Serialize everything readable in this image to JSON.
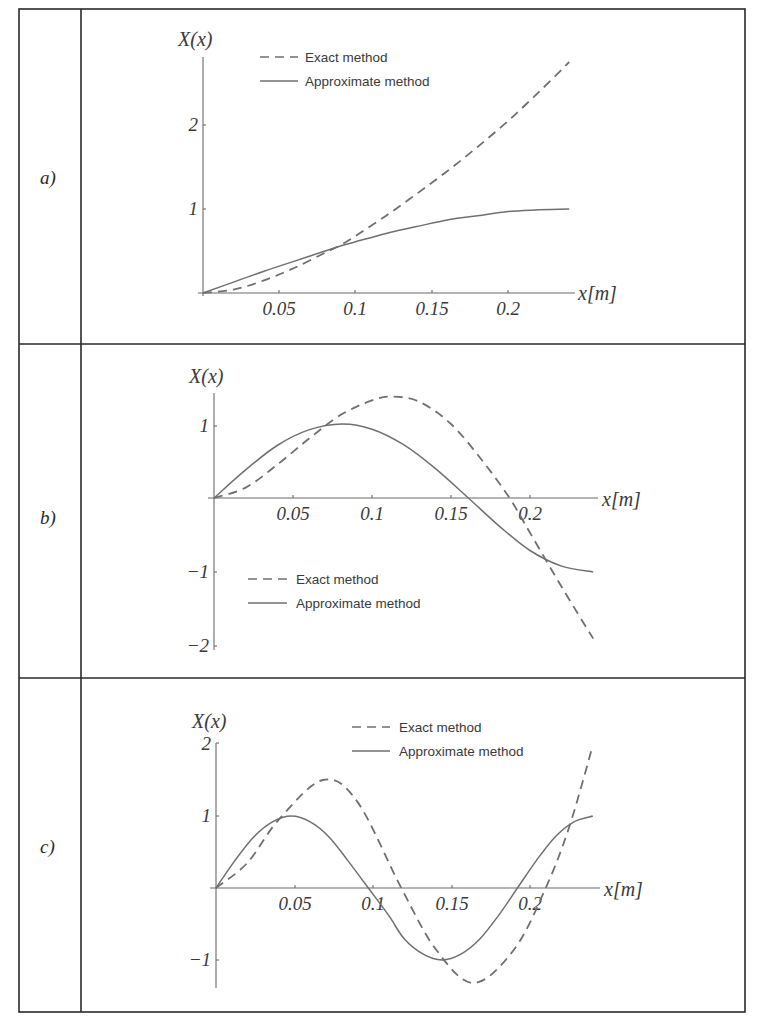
{
  "table": {
    "row_labels": [
      "a)",
      "b)",
      "c)"
    ]
  },
  "legend": {
    "exact": "Exact method",
    "approx": "Approximate method"
  },
  "axis": {
    "y_title": "X(x)",
    "x_title": "x[m]"
  },
  "colors": {
    "border": "#2a2a2a",
    "axis": "#6a6a6a",
    "curve": "#707070",
    "text": "#3a3a3a"
  },
  "chart_data": [
    {
      "id": "a",
      "type": "line",
      "title": "",
      "xlabel": "x[m]",
      "ylabel": "X(x)",
      "xlim": [
        0,
        0.24
      ],
      "ylim": [
        0,
        2.75
      ],
      "x_ticks": [
        0.05,
        0.1,
        0.15,
        0.2
      ],
      "x_tick_labels": [
        "0.05",
        "0.1",
        "0.15",
        "0.2"
      ],
      "y_ticks": [
        1,
        2
      ],
      "y_tick_labels": [
        "1",
        "2"
      ],
      "grid": false,
      "legend_position": "top-left",
      "series": [
        {
          "name": "Exact method",
          "style": "dashed",
          "x": [
            0,
            0.02,
            0.04,
            0.06,
            0.08,
            0.09,
            0.1,
            0.12,
            0.14,
            0.16,
            0.18,
            0.2,
            0.22,
            0.24
          ],
          "values": [
            0,
            0.04,
            0.15,
            0.3,
            0.48,
            0.57,
            0.68,
            0.92,
            1.18,
            1.45,
            1.74,
            2.05,
            2.39,
            2.75
          ]
        },
        {
          "name": "Approximate method",
          "style": "solid",
          "x": [
            0,
            0.02,
            0.04,
            0.06,
            0.08,
            0.09,
            0.1,
            0.12,
            0.14,
            0.16,
            0.18,
            0.2,
            0.22,
            0.24
          ],
          "values": [
            0,
            0.13,
            0.26,
            0.38,
            0.5,
            0.56,
            0.61,
            0.71,
            0.79,
            0.87,
            0.92,
            0.97,
            0.99,
            1.0
          ]
        }
      ]
    },
    {
      "id": "b",
      "type": "line",
      "title": "",
      "xlabel": "x[m]",
      "ylabel": "X(x)",
      "xlim": [
        0,
        0.24
      ],
      "ylim": [
        -2,
        1.4
      ],
      "x_ticks": [
        0.05,
        0.1,
        0.15,
        0.2
      ],
      "x_tick_labels": [
        "0.05",
        "0.1",
        "0.15",
        "0.2"
      ],
      "y_ticks": [
        1,
        -1,
        -2
      ],
      "y_tick_labels": [
        "1",
        "-1",
        "-2"
      ],
      "grid": false,
      "legend_position": "bottom-left",
      "series": [
        {
          "name": "Exact method",
          "style": "dashed",
          "x": [
            0,
            0.02,
            0.04,
            0.06,
            0.08,
            0.1,
            0.113,
            0.13,
            0.15,
            0.17,
            0.187,
            0.2,
            0.22,
            0.24
          ],
          "values": [
            0,
            0.14,
            0.45,
            0.8,
            1.12,
            1.32,
            1.37,
            1.3,
            1.0,
            0.5,
            0.0,
            -0.47,
            -1.2,
            -1.9
          ]
        },
        {
          "name": "Approximate method",
          "style": "solid",
          "x": [
            0,
            0.02,
            0.04,
            0.06,
            0.081,
            0.1,
            0.12,
            0.14,
            0.161,
            0.18,
            0.2,
            0.22,
            0.24
          ],
          "values": [
            0,
            0.38,
            0.71,
            0.92,
            1.0,
            0.93,
            0.72,
            0.4,
            0.0,
            -0.37,
            -0.71,
            -0.92,
            -1.0
          ]
        }
      ]
    },
    {
      "id": "c",
      "type": "line",
      "title": "",
      "xlabel": "x[m]",
      "ylabel": "X(x)",
      "xlim": [
        0,
        0.24
      ],
      "ylim": [
        -1.35,
        2
      ],
      "x_ticks": [
        0.05,
        0.1,
        0.15,
        0.2
      ],
      "x_tick_labels": [
        "0.05",
        "0.1",
        "0.15",
        "0.2"
      ],
      "y_ticks": [
        2,
        1,
        -1
      ],
      "y_tick_labels": [
        "2",
        "1",
        "-1"
      ],
      "grid": false,
      "legend_position": "top-right",
      "series": [
        {
          "name": "Exact method",
          "style": "dashed",
          "x": [
            0,
            0.02,
            0.04,
            0.068,
            0.09,
            0.118,
            0.14,
            0.164,
            0.19,
            0.21,
            0.225,
            0.24
          ],
          "values": [
            0,
            0.35,
            0.95,
            1.5,
            1.2,
            0.0,
            -0.85,
            -1.32,
            -0.85,
            0.0,
            0.85,
            1.98
          ]
        },
        {
          "name": "Approximate method",
          "style": "solid",
          "x": [
            0,
            0.012,
            0.024,
            0.036,
            0.048,
            0.06,
            0.072,
            0.084,
            0.097,
            0.11,
            0.12,
            0.132,
            0.144,
            0.156,
            0.168,
            0.18,
            0.192,
            0.204,
            0.216,
            0.228,
            0.24
          ],
          "values": [
            0,
            0.38,
            0.71,
            0.92,
            1.0,
            0.92,
            0.71,
            0.38,
            0.0,
            -0.38,
            -0.71,
            -0.92,
            -1.0,
            -0.92,
            -0.71,
            -0.38,
            0.0,
            0.38,
            0.71,
            0.92,
            1.0
          ]
        }
      ]
    }
  ]
}
